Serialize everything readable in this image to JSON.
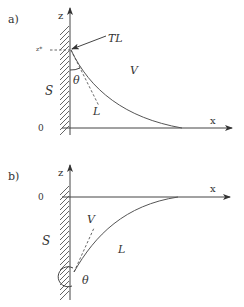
{
  "panels": [
    {
      "id": "a",
      "label": "a)",
      "axis_z_label": "z",
      "axis_x_label": "x",
      "origin_label": "0",
      "zstar_label": "z*",
      "wall_label": "S",
      "region_upper_label": "V",
      "region_lower_label": "L",
      "triple_line_label": "TL",
      "angle_label": "θ"
    },
    {
      "id": "b",
      "label": "b)",
      "axis_z_label": "z",
      "axis_x_label": "x",
      "origin_label": "0",
      "wall_label": "S",
      "region_upper_label": "V",
      "region_lower_label": "L",
      "angle_label": "θ"
    }
  ]
}
